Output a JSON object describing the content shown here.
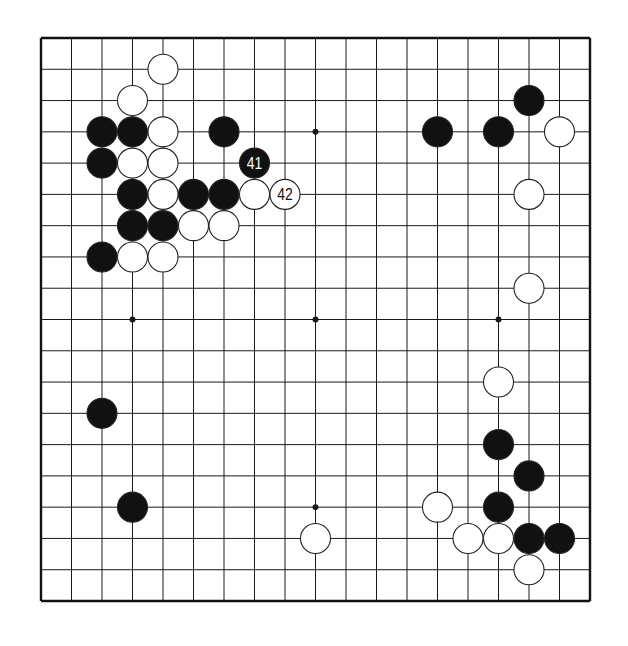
{
  "board": {
    "size": 19,
    "origin_x": 41,
    "origin_y": 38,
    "width": 549,
    "height": 563,
    "stone_radius": 15,
    "line_color": "#1a1a1a",
    "border_color": "#111111",
    "black_color": "#111111",
    "white_color": "#ffffff",
    "star_points": [
      [
        3,
        3
      ],
      [
        9,
        3
      ],
      [
        15,
        3
      ],
      [
        3,
        9
      ],
      [
        9,
        9
      ],
      [
        15,
        9
      ],
      [
        3,
        15
      ],
      [
        9,
        15
      ],
      [
        15,
        15
      ]
    ]
  },
  "stones": [
    {
      "color": "white",
      "col": 4,
      "row": 1
    },
    {
      "color": "white",
      "col": 3,
      "row": 2
    },
    {
      "color": "black",
      "col": 2,
      "row": 3
    },
    {
      "color": "black",
      "col": 3,
      "row": 3
    },
    {
      "color": "white",
      "col": 4,
      "row": 3
    },
    {
      "color": "black",
      "col": 6,
      "row": 3
    },
    {
      "color": "black",
      "col": 2,
      "row": 4
    },
    {
      "color": "white",
      "col": 3,
      "row": 4
    },
    {
      "color": "white",
      "col": 4,
      "row": 4
    },
    {
      "color": "black",
      "col": 7,
      "row": 4,
      "label": "41"
    },
    {
      "color": "black",
      "col": 3,
      "row": 5
    },
    {
      "color": "white",
      "col": 4,
      "row": 5
    },
    {
      "color": "black",
      "col": 5,
      "row": 5
    },
    {
      "color": "black",
      "col": 6,
      "row": 5
    },
    {
      "color": "white",
      "col": 7,
      "row": 5
    },
    {
      "color": "white",
      "col": 8,
      "row": 5,
      "label": "42"
    },
    {
      "color": "black",
      "col": 3,
      "row": 6
    },
    {
      "color": "black",
      "col": 4,
      "row": 6
    },
    {
      "color": "white",
      "col": 5,
      "row": 6
    },
    {
      "color": "white",
      "col": 6,
      "row": 6
    },
    {
      "color": "black",
      "col": 2,
      "row": 7
    },
    {
      "color": "white",
      "col": 3,
      "row": 7
    },
    {
      "color": "white",
      "col": 4,
      "row": 7
    },
    {
      "color": "black",
      "col": 16,
      "row": 2
    },
    {
      "color": "black",
      "col": 13,
      "row": 3
    },
    {
      "color": "black",
      "col": 15,
      "row": 3
    },
    {
      "color": "white",
      "col": 17,
      "row": 3
    },
    {
      "color": "white",
      "col": 16,
      "row": 5
    },
    {
      "color": "white",
      "col": 16,
      "row": 8
    },
    {
      "color": "white",
      "col": 15,
      "row": 11
    },
    {
      "color": "black",
      "col": 15,
      "row": 13
    },
    {
      "color": "black",
      "col": 16,
      "row": 14
    },
    {
      "color": "white",
      "col": 13,
      "row": 15
    },
    {
      "color": "black",
      "col": 15,
      "row": 15
    },
    {
      "color": "white",
      "col": 14,
      "row": 16
    },
    {
      "color": "white",
      "col": 15,
      "row": 16
    },
    {
      "color": "black",
      "col": 16,
      "row": 16
    },
    {
      "color": "black",
      "col": 17,
      "row": 16
    },
    {
      "color": "white",
      "col": 16,
      "row": 17
    },
    {
      "color": "black",
      "col": 2,
      "row": 12
    },
    {
      "color": "black",
      "col": 3,
      "row": 15
    },
    {
      "color": "white",
      "col": 9,
      "row": 16
    }
  ]
}
